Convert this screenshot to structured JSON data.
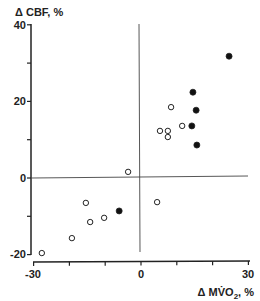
{
  "chart_data": {
    "type": "scatter",
    "title": "",
    "xlabel": "Δ MV̇O₂, %",
    "ylabel": "Δ CBF, %",
    "xlim": [
      -30,
      30
    ],
    "ylim": [
      -20,
      40
    ],
    "x_ticks": [
      -30,
      -20,
      -10,
      0,
      10,
      20,
      30
    ],
    "x_tick_labels": [
      "-30",
      "",
      "",
      "0",
      "",
      "",
      "30"
    ],
    "y_ticks": [
      -20,
      -10,
      0,
      10,
      20,
      30,
      40
    ],
    "y_tick_labels": [
      "-20",
      "",
      "0",
      "",
      "20",
      "",
      "40"
    ],
    "grid": false,
    "reference_lines": {
      "x": 0,
      "y": 0
    },
    "legend": null,
    "series": [
      {
        "name": "open circles",
        "marker": "open-circle",
        "points": [
          [
            -27.7,
            -19.6
          ],
          [
            -19.3,
            -15.7
          ],
          [
            -15.4,
            -6.5
          ],
          [
            -14.2,
            -11.5
          ],
          [
            -10.3,
            -10.4
          ],
          [
            -3.6,
            1.6
          ],
          [
            4.5,
            -6.3
          ],
          [
            5.3,
            12.3
          ],
          [
            7.5,
            12.3
          ],
          [
            7.5,
            10.7
          ],
          [
            8.4,
            18.5
          ],
          [
            11.5,
            13.6
          ]
        ]
      },
      {
        "name": "filled circles",
        "marker": "filled-circle",
        "points": [
          [
            -6.1,
            -8.6
          ],
          [
            14.2,
            13.6
          ],
          [
            14.5,
            22.4
          ],
          [
            15.4,
            17.7
          ],
          [
            15.6,
            8.6
          ],
          [
            24.6,
            31.8
          ]
        ]
      }
    ]
  },
  "labels": {
    "ylabel_text": "Δ CBF, %",
    "xlabel_main": "Δ MV̇O",
    "xlabel_sub": "2",
    "xlabel_tail": ", %",
    "y40": "40",
    "y20": "20",
    "y0": "0",
    "yneg20": "-20",
    "xneg30": "-30",
    "x0": "0",
    "x30": "30"
  }
}
